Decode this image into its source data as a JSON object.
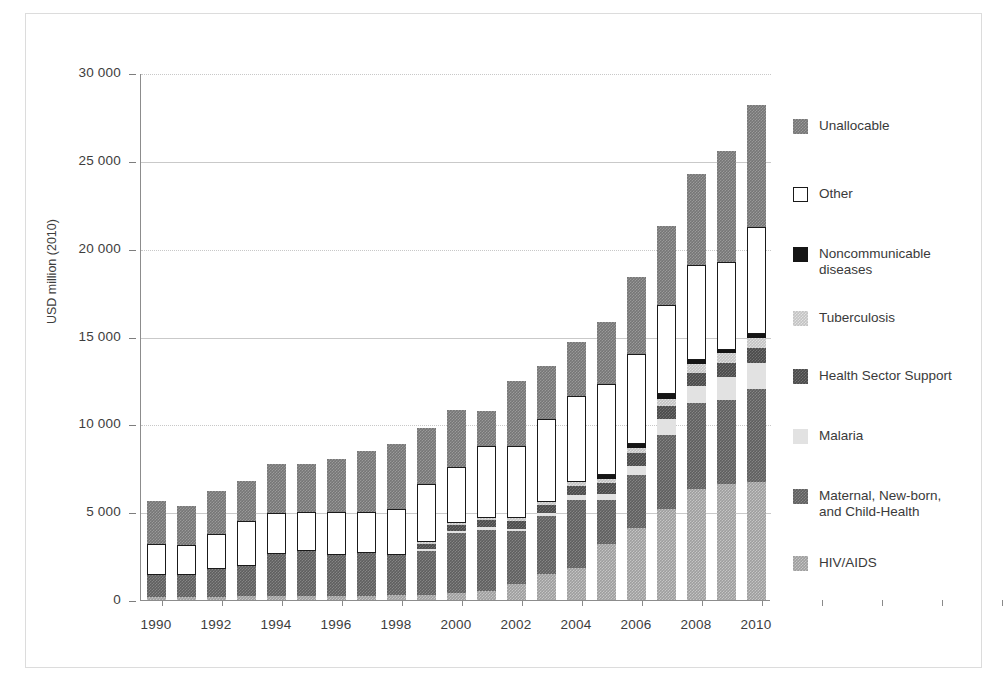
{
  "figure": {
    "y_axis_title": "USD million (2010)"
  },
  "legend": {
    "position": "right",
    "items": [
      {
        "label": "Unallocable",
        "key": "unallocable",
        "color": "#767676"
      },
      {
        "label": "Other",
        "key": "other",
        "color": "#ffffff"
      },
      {
        "label": "Noncommunicable\ndiseases",
        "key": "ncd",
        "color": "#151515"
      },
      {
        "label": "Tuberculosis",
        "key": "tb",
        "color": "#c3c3c3"
      },
      {
        "label": "Health Sector Support",
        "key": "hss",
        "color": "#4a4a4a"
      },
      {
        "label": "Malaria",
        "key": "malaria",
        "color": "#e2e2e2"
      },
      {
        "label": "Maternal, New-born,\nand Child-Health",
        "key": "mnch",
        "color": "#5f5f5f"
      },
      {
        "label": "HIV/AIDS",
        "key": "hiv",
        "color": "#9e9e9e"
      }
    ]
  },
  "chart_data": {
    "type": "bar",
    "stacked": true,
    "title": "",
    "xlabel": "",
    "ylabel": "USD million (2010)",
    "ylim": [
      0,
      30000
    ],
    "ytick_labels": [
      "0",
      "5 000",
      "10 000",
      "15 000",
      "20 000",
      "25 000",
      "30 000"
    ],
    "ytick_values": [
      0,
      5000,
      10000,
      15000,
      20000,
      25000,
      30000
    ],
    "grid": "horizontal",
    "x": [
      1990,
      1991,
      1992,
      1993,
      1994,
      1995,
      1996,
      1997,
      1998,
      1999,
      2000,
      2001,
      2002,
      2003,
      2004,
      2005,
      2006,
      2007,
      2008,
      2009,
      2010
    ],
    "xtick_labels": [
      "1990",
      "",
      "1992",
      "",
      "1994",
      "",
      "1996",
      "",
      "1998",
      "",
      "2000",
      "",
      "2002",
      "",
      "2004",
      "",
      "2006",
      "",
      "2008",
      "",
      "2010"
    ],
    "stack_order_bottom_to_top": [
      "hiv",
      "mnch",
      "malaria",
      "hss",
      "tb",
      "ncd",
      "other",
      "unallocable"
    ],
    "series": [
      {
        "name": "HIV/AIDS",
        "key": "hiv",
        "values": [
          150,
          150,
          180,
          200,
          230,
          250,
          250,
          250,
          280,
          300,
          400,
          500,
          900,
          1500,
          1800,
          3200,
          4100,
          5200,
          6300,
          6600,
          6700
        ]
      },
      {
        "name": "Maternal, New-born, and Child-Health",
        "key": "mnch",
        "values": [
          1250,
          1300,
          1600,
          1750,
          2400,
          2550,
          2300,
          2400,
          2300,
          2500,
          3400,
          3500,
          3000,
          3300,
          3900,
          2500,
          3000,
          4200,
          4900,
          4800,
          5300
        ]
      },
      {
        "name": "Malaria",
        "key": "malaria",
        "values": [
          0,
          0,
          0,
          0,
          0,
          0,
          0,
          0,
          0,
          100,
          120,
          130,
          150,
          150,
          250,
          350,
          550,
          900,
          1000,
          1300,
          1500
        ]
      },
      {
        "name": "Health Sector Support",
        "key": "hss",
        "values": [
          0,
          0,
          0,
          0,
          0,
          0,
          0,
          0,
          0,
          300,
          350,
          400,
          450,
          450,
          550,
          600,
          700,
          750,
          750,
          800,
          850
        ]
      },
      {
        "name": "Tuberculosis",
        "key": "tb",
        "values": [
          0,
          0,
          0,
          0,
          0,
          0,
          0,
          0,
          0,
          100,
          120,
          150,
          180,
          200,
          200,
          250,
          300,
          400,
          500,
          550,
          550
        ]
      },
      {
        "name": "Noncommunicable diseases",
        "key": "ncd",
        "values": [
          0,
          0,
          0,
          0,
          0,
          0,
          0,
          0,
          0,
          0,
          0,
          0,
          0,
          0,
          0,
          200,
          250,
          250,
          200,
          200,
          250
        ]
      },
      {
        "name": "Other",
        "key": "other",
        "values": [
          1800,
          1700,
          2000,
          2550,
          2350,
          2200,
          2450,
          2350,
          2600,
          3300,
          3200,
          4100,
          4100,
          4700,
          4900,
          5200,
          5100,
          5100,
          5400,
          5000,
          6100
        ]
      },
      {
        "name": "Unallocable",
        "key": "unallocable",
        "values": [
          2450,
          2200,
          2400,
          2250,
          2750,
          2750,
          3000,
          3500,
          3700,
          3200,
          3200,
          2000,
          3700,
          3000,
          3100,
          3500,
          4400,
          4500,
          5200,
          6300,
          6900
        ]
      }
    ],
    "totals": [
      5650,
      5350,
      6180,
      6750,
      7730,
      7950,
      8000,
      8500,
      8880,
      9800,
      10790,
      10780,
      12480,
      13300,
      14700,
      15800,
      18400,
      21300,
      24250,
      25550,
      28150
    ]
  }
}
